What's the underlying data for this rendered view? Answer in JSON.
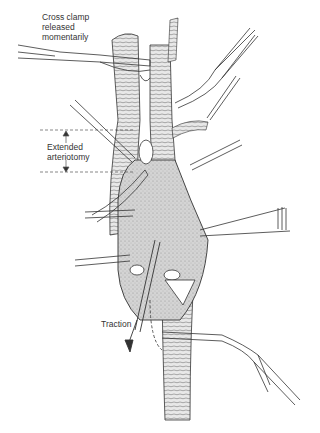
{
  "figure": {
    "type": "surgical illustration",
    "labels": {
      "cross_clamp_line1": "Cross clamp",
      "cross_clamp_line2": "released",
      "cross_clamp_line3": "momentarily",
      "arteriotomy_line1": "Extended",
      "arteriotomy_line2": "arteriotomy",
      "traction": "Traction"
    },
    "colors": {
      "line": "#333333",
      "shade": "#bdbdbd",
      "background": "#ffffff"
    }
  }
}
